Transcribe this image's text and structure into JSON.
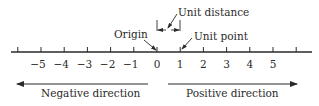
{
  "colors": {
    "ink": "#2a2a2a",
    "background": "#ffffff"
  },
  "axis": {
    "tick_values": [
      -6,
      -5,
      -4,
      -3,
      -2,
      -1,
      0,
      1,
      2,
      3,
      4,
      5,
      6
    ],
    "labeled_ticks": [
      "−5",
      "−4",
      "−3",
      "−2",
      "−1",
      "0",
      "1",
      "2",
      "3",
      "4",
      "5"
    ]
  },
  "annotations": {
    "origin": "Origin",
    "unit_distance": "Unit distance",
    "unit_point": "Unit point"
  },
  "directions": {
    "negative": "Negative direction",
    "positive": "Positive direction"
  }
}
